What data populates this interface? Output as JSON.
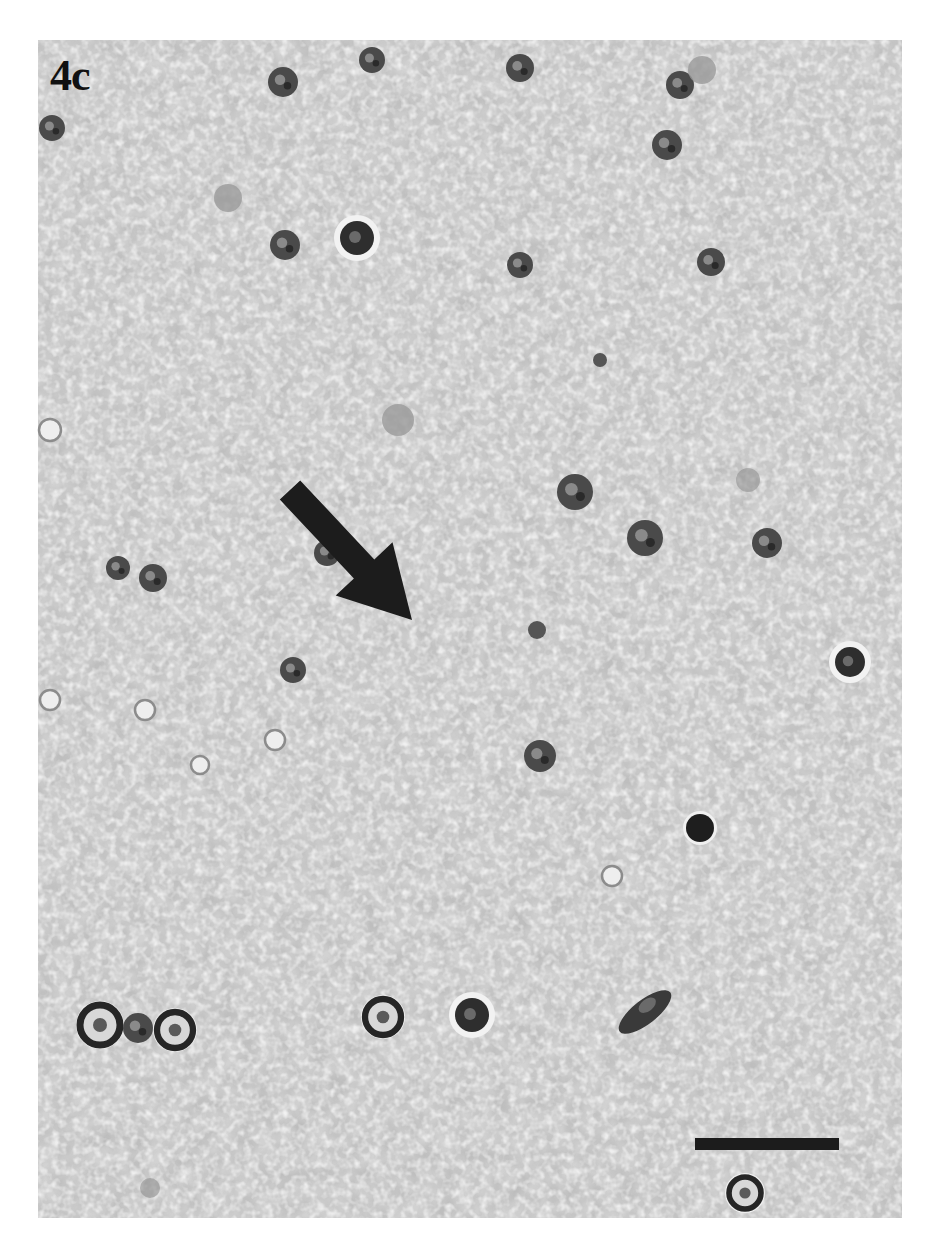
{
  "figure": {
    "panel_label": "4c",
    "image_type": "histology micrograph (grayscale)",
    "background_color": "#ffffff",
    "tissue_base_color": "#cfcfcf",
    "annotation_color": "#1c1c1c",
    "panel_bounds": {
      "left": 38,
      "top": 40,
      "width": 864,
      "height": 1178
    },
    "arrow": {
      "description": "black arrow pointing down-right",
      "tail": [
        290,
        490
      ],
      "head": [
        412,
        620
      ]
    },
    "scale_bar": {
      "label": "",
      "x": 695,
      "y": 1138,
      "width": 144,
      "height": 12
    },
    "cells": [
      {
        "x": 52,
        "y": 128,
        "r": 13,
        "type": "dark-nucleus"
      },
      {
        "x": 283,
        "y": 82,
        "r": 15,
        "type": "dark-nucleus"
      },
      {
        "x": 372,
        "y": 60,
        "r": 13,
        "type": "dark-nucleus"
      },
      {
        "x": 520,
        "y": 68,
        "r": 14,
        "type": "dark-nucleus"
      },
      {
        "x": 680,
        "y": 85,
        "r": 14,
        "type": "dark-nucleus"
      },
      {
        "x": 702,
        "y": 70,
        "r": 14,
        "type": "pale-body"
      },
      {
        "x": 667,
        "y": 145,
        "r": 15,
        "type": "dark-nucleus"
      },
      {
        "x": 228,
        "y": 198,
        "r": 14,
        "type": "pale-body"
      },
      {
        "x": 285,
        "y": 245,
        "r": 15,
        "type": "dark-nucleus"
      },
      {
        "x": 357,
        "y": 238,
        "r": 17,
        "type": "dark-nucleus-halo"
      },
      {
        "x": 520,
        "y": 265,
        "r": 13,
        "type": "dark-nucleus"
      },
      {
        "x": 711,
        "y": 262,
        "r": 14,
        "type": "dark-nucleus"
      },
      {
        "x": 600,
        "y": 360,
        "r": 7,
        "type": "small-dark"
      },
      {
        "x": 398,
        "y": 420,
        "r": 16,
        "type": "pale-body"
      },
      {
        "x": 50,
        "y": 430,
        "r": 11,
        "type": "ring"
      },
      {
        "x": 575,
        "y": 492,
        "r": 18,
        "type": "dark-nucleus"
      },
      {
        "x": 645,
        "y": 538,
        "r": 18,
        "type": "dark-nucleus"
      },
      {
        "x": 748,
        "y": 480,
        "r": 12,
        "type": "faint"
      },
      {
        "x": 767,
        "y": 543,
        "r": 15,
        "type": "dark-nucleus"
      },
      {
        "x": 118,
        "y": 568,
        "r": 12,
        "type": "dark-nucleus"
      },
      {
        "x": 153,
        "y": 578,
        "r": 14,
        "type": "dark-nucleus"
      },
      {
        "x": 327,
        "y": 553,
        "r": 13,
        "type": "dark-nucleus"
      },
      {
        "x": 537,
        "y": 630,
        "r": 9,
        "type": "small-dark"
      },
      {
        "x": 293,
        "y": 670,
        "r": 13,
        "type": "dark-nucleus"
      },
      {
        "x": 850,
        "y": 662,
        "r": 15,
        "type": "dark-nucleus-halo"
      },
      {
        "x": 540,
        "y": 756,
        "r": 16,
        "type": "dark-nucleus"
      },
      {
        "x": 700,
        "y": 828,
        "r": 14,
        "type": "solid-dark"
      },
      {
        "x": 612,
        "y": 876,
        "r": 10,
        "type": "ring"
      },
      {
        "x": 100,
        "y": 1025,
        "r": 20,
        "type": "dark-nucleus-ring"
      },
      {
        "x": 138,
        "y": 1028,
        "r": 15,
        "type": "dark-nucleus"
      },
      {
        "x": 175,
        "y": 1030,
        "r": 18,
        "type": "dark-nucleus-ring"
      },
      {
        "x": 383,
        "y": 1017,
        "r": 18,
        "type": "dark-nucleus-ring"
      },
      {
        "x": 472,
        "y": 1015,
        "r": 17,
        "type": "dark-nucleus-halo"
      },
      {
        "x": 645,
        "y": 1012,
        "r": 20,
        "type": "elongated"
      },
      {
        "x": 745,
        "y": 1193,
        "r": 16,
        "type": "dark-nucleus-ring"
      },
      {
        "x": 150,
        "y": 1188,
        "r": 10,
        "type": "faint"
      },
      {
        "x": 50,
        "y": 700,
        "r": 10,
        "type": "ring"
      },
      {
        "x": 145,
        "y": 710,
        "r": 10,
        "type": "ring"
      },
      {
        "x": 200,
        "y": 765,
        "r": 9,
        "type": "ring"
      },
      {
        "x": 275,
        "y": 740,
        "r": 10,
        "type": "ring"
      }
    ]
  }
}
